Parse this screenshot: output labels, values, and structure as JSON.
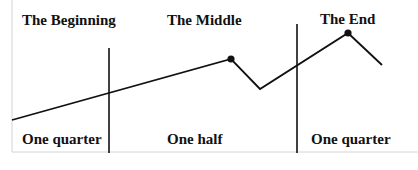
{
  "diagram": {
    "top_labels": [
      {
        "text": "The Beginning"
      },
      {
        "text": "The Middle"
      },
      {
        "text": "The End"
      }
    ],
    "bottom_labels": [
      {
        "text": "One quarter"
      },
      {
        "text": "One half"
      },
      {
        "text": "One quarter"
      }
    ],
    "colors": {
      "line": "#111111",
      "frame": "#d4d4d4",
      "background": "#ffffff"
    }
  }
}
